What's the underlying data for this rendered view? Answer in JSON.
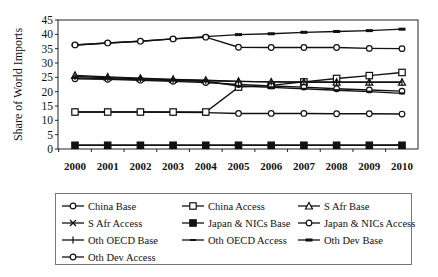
{
  "chart_data": {
    "type": "line",
    "title": "",
    "xlabel": "",
    "ylabel": "Share of World Imports",
    "ylim": [
      0,
      45
    ],
    "yticks": [
      0,
      5,
      10,
      15,
      20,
      25,
      30,
      35,
      40,
      45
    ],
    "grid": false,
    "legend_position": "bottom",
    "x": [
      "2000",
      "2001",
      "2002",
      "2003",
      "2004",
      "2005",
      "2006",
      "2007",
      "2008",
      "2009",
      "2010"
    ],
    "series": [
      {
        "name": "China Base",
        "marker": "diamond-open",
        "values": [
          12.9,
          12.9,
          12.9,
          12.8,
          12.7,
          12.4,
          12.4,
          12.4,
          12.3,
          12.3,
          12.2
        ]
      },
      {
        "name": "China Access",
        "marker": "square-open",
        "values": [
          12.9,
          12.9,
          12.9,
          12.9,
          12.9,
          21.6,
          22.2,
          23.4,
          24.6,
          25.6,
          26.7
        ]
      },
      {
        "name": "S Afr Base",
        "marker": "triangle-open",
        "values": [
          25.7,
          25.1,
          24.7,
          24.3,
          24.0,
          23.6,
          23.4,
          23.3,
          23.3,
          23.3,
          23.3
        ]
      },
      {
        "name": "S Afr Access",
        "marker": "x",
        "values": [
          1.3,
          1.3,
          1.3,
          1.3,
          1.3,
          1.3,
          1.3,
          1.3,
          1.3,
          1.3,
          1.4
        ]
      },
      {
        "name": "Japan & NICs Base",
        "marker": "square-filled",
        "values": [
          1.3,
          1.3,
          1.3,
          1.3,
          1.3,
          1.3,
          1.3,
          1.3,
          1.3,
          1.3,
          1.3
        ]
      },
      {
        "name": "Japan & NICs Access",
        "marker": "circle-open",
        "values": [
          24.5,
          24.3,
          24.0,
          23.6,
          23.2,
          22.5,
          22.0,
          21.6,
          21.0,
          20.6,
          20.2
        ]
      },
      {
        "name": "Oth OECD Base",
        "marker": "plus",
        "values": [
          25.3,
          24.9,
          24.5,
          24.2,
          23.8,
          23.6,
          23.4,
          23.4,
          23.3,
          23.3,
          23.3
        ]
      },
      {
        "name": "Oth OECD Access",
        "marker": "dash",
        "values": [
          24.8,
          24.5,
          24.2,
          23.9,
          23.6,
          22.0,
          21.5,
          21.0,
          20.5,
          20.0,
          19.4
        ]
      },
      {
        "name": "Oth Dev Base",
        "marker": "dash-thick",
        "values": [
          36.3,
          37.0,
          37.6,
          38.4,
          39.2,
          39.9,
          40.2,
          40.7,
          41.0,
          41.3,
          41.8
        ]
      },
      {
        "name": "Oth Dev Access",
        "marker": "diamond-open",
        "values": [
          36.3,
          37.0,
          37.6,
          38.4,
          39.0,
          35.5,
          35.4,
          35.4,
          35.4,
          35.1,
          35.0
        ]
      }
    ]
  },
  "axis": {
    "ylabel": "Share of World Imports",
    "yticks": [
      "0",
      "5",
      "10",
      "15",
      "20",
      "25",
      "30",
      "35",
      "40",
      "45"
    ],
    "xticks": [
      "2000",
      "2001",
      "2002",
      "2003",
      "2004",
      "2005",
      "2006",
      "2007",
      "2008",
      "2009",
      "2010"
    ]
  },
  "legend": {
    "items": [
      {
        "label": "China Base",
        "marker": "diamond-open"
      },
      {
        "label": "China Access",
        "marker": "square-open"
      },
      {
        "label": "S Afr Base",
        "marker": "triangle-open"
      },
      {
        "label": "S Afr Access",
        "marker": "x"
      },
      {
        "label": "Japan & NICs Base",
        "marker": "square-filled"
      },
      {
        "label": "Japan & NICs Access",
        "marker": "circle-open"
      },
      {
        "label": "Oth OECD Base",
        "marker": "plus"
      },
      {
        "label": "Oth OECD Access",
        "marker": "dash"
      },
      {
        "label": "Oth Dev Base",
        "marker": "dash-thick"
      },
      {
        "label": "Oth Dev Access",
        "marker": "diamond-open"
      }
    ]
  }
}
